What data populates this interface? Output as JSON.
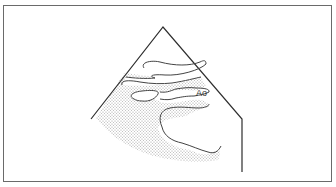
{
  "diagram": {
    "type": "echocardiogram-sector-schematic",
    "labels": [
      {
        "id": "aorta",
        "text": "Ao"
      }
    ],
    "colors": {
      "line": "#3a3a3a",
      "frame": "#6a6a6a",
      "shading": "#bdbdbd",
      "background": "#ffffff"
    }
  }
}
